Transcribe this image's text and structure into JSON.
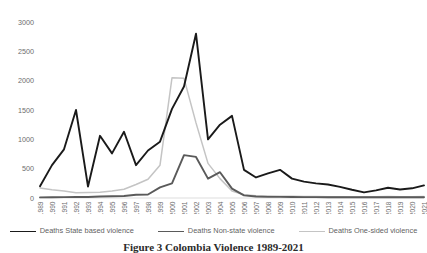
{
  "caption": "Figure 3 Colombia Violence 1989-2021",
  "legend": {
    "position": "bottom",
    "items": [
      {
        "label": "Deaths State based violence",
        "color": "#1a1a1a",
        "width": 1.9
      },
      {
        "label": "Deaths Non-state violence",
        "color": "#5a5a5a",
        "width": 1.9
      },
      {
        "label": "Deaths One-sided violence",
        "color": "#c4c4c4",
        "width": 1.4
      }
    ]
  },
  "axes": {
    "y_ticks": [
      "0",
      "500",
      "1000",
      "1500",
      "2000",
      "2500",
      "3000"
    ],
    "x_label": "",
    "y_label": "",
    "grid": false
  },
  "chart_data": {
    "type": "line",
    "title": "Figure 3 Colombia Violence 1989-2021",
    "xlabel": "",
    "ylabel": "",
    "ylim": [
      0,
      3000
    ],
    "ytick_step": 500,
    "grid": false,
    "legend_position": "bottom",
    "categories": [
      "1989",
      "1990",
      "1991",
      "1992",
      "1993",
      "1994",
      "1995",
      "1996",
      "1997",
      "1998",
      "1999",
      "2000",
      "2001",
      "2002",
      "2003",
      "2004",
      "2005",
      "2006",
      "2007",
      "2008",
      "2009",
      "2010",
      "2011",
      "2012",
      "2013",
      "2014",
      "2015",
      "2016",
      "2017",
      "2018",
      "2019",
      "2020",
      "2021"
    ],
    "series": [
      {
        "name": "Deaths State based violence",
        "color": "#1a1a1a",
        "values": [
          200,
          560,
          830,
          1500,
          195,
          1060,
          760,
          1130,
          560,
          810,
          960,
          1520,
          1900,
          2800,
          1000,
          1250,
          1400,
          480,
          350,
          420,
          480,
          330,
          280,
          250,
          230,
          190,
          140,
          95,
          130,
          175,
          145,
          165,
          215
        ]
      },
      {
        "name": "Deaths Non-state violence",
        "color": "#5a5a5a",
        "values": [
          10,
          12,
          15,
          20,
          18,
          25,
          30,
          35,
          55,
          60,
          180,
          250,
          730,
          700,
          330,
          440,
          160,
          45,
          25,
          20,
          20,
          18,
          15,
          15,
          14,
          14,
          14,
          14,
          14,
          14,
          14,
          14,
          14
        ]
      },
      {
        "name": "Deaths One-sided violence",
        "color": "#c4c4c4",
        "values": [
          170,
          140,
          120,
          90,
          95,
          100,
          120,
          150,
          230,
          320,
          560,
          2050,
          2040,
          1280,
          590,
          330,
          120,
          55,
          40,
          35,
          30,
          28,
          26,
          24,
          22,
          20,
          18,
          18,
          22,
          24,
          22,
          22,
          24
        ]
      }
    ]
  }
}
